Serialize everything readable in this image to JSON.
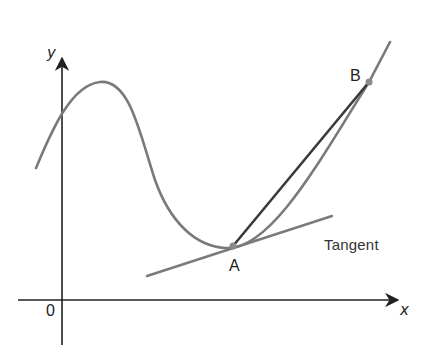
{
  "diagram": {
    "type": "function graph with secant and tangent",
    "colors": {
      "axes": "#222222",
      "curve": "#7a7a7a",
      "secant": "#3a3a3a",
      "tangent": "#7a7a7a",
      "points": "#8a8a8a",
      "background": "#ffffff"
    },
    "labels": {
      "y_axis": "y",
      "x_axis": "x",
      "origin": "0",
      "point_a": "A",
      "point_b": "B",
      "tangent": "Tangent"
    },
    "elements": [
      {
        "kind": "axis",
        "name": "x-axis",
        "from": [
          18,
          300
        ],
        "to": [
          398,
          300
        ]
      },
      {
        "kind": "axis",
        "name": "y-axis",
        "from": [
          62,
          345
        ],
        "to": [
          62,
          58
        ]
      },
      {
        "kind": "curve",
        "name": "function-curve",
        "description": "smooth curve rising to a local maximum left of center, dipping to a minimum at A, then rising steeply through B"
      },
      {
        "kind": "point",
        "name": "A",
        "at": [
          233,
          246
        ]
      },
      {
        "kind": "point",
        "name": "B",
        "at": [
          369,
          82
        ]
      },
      {
        "kind": "line",
        "name": "secant-AB",
        "from": [
          233,
          246
        ],
        "to": [
          369,
          82
        ]
      },
      {
        "kind": "line",
        "name": "tangent-at-A",
        "from": [
          147,
          276
        ],
        "to": [
          332,
          216
        ]
      }
    ]
  }
}
